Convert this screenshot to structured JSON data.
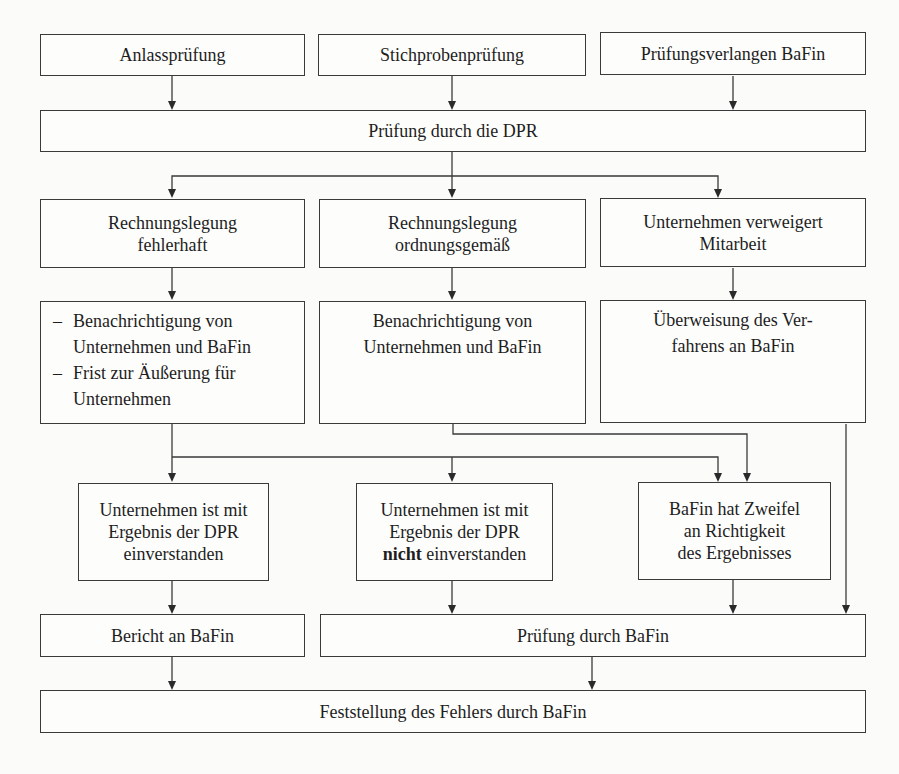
{
  "diagram": {
    "row1": [
      {
        "label": "Anlassprüfung"
      },
      {
        "label": "Stichprobenprüfung"
      },
      {
        "label": "Prüfungsverlangen BaFin"
      }
    ],
    "row2": {
      "label": "Prüfung durch die DPR"
    },
    "row3": [
      {
        "line1": "Rechnungslegung",
        "line2": "fehlerhaft"
      },
      {
        "line1": "Rechnungslegung",
        "line2": "ordnungsgemäß"
      },
      {
        "line1": "Unternehmen verweigert",
        "line2": "Mitarbeit"
      }
    ],
    "row4": {
      "left": {
        "items": [
          {
            "dash": "–",
            "line1": "Benachrichtigung von",
            "line2": "Unternehmen und BaFin"
          },
          {
            "dash": "–",
            "line1": "Frist zur Äußerung für",
            "line2": "Unternehmen"
          }
        ]
      },
      "middle": {
        "line1": "Benachrichtigung von",
        "line2": "Unternehmen und BaFin"
      },
      "right": {
        "line1": "Überweisung des Ver-",
        "line2": "fahrens an BaFin"
      }
    },
    "row5": [
      {
        "line1": "Unternehmen ist mit",
        "line2": "Ergebnis der DPR",
        "line3": "einverstanden"
      },
      {
        "line1": "Unternehmen ist mit",
        "line2": "Ergebnis der DPR",
        "line3_bold": "nicht",
        "line3_rest": " einverstanden"
      },
      {
        "line1": "BaFin hat Zweifel",
        "line2": "an Richtigkeit",
        "line3": "des Ergebnisses"
      }
    ],
    "row6": [
      {
        "label": "Bericht an BaFin"
      },
      {
        "label": "Prüfung durch BaFin"
      }
    ],
    "row7": {
      "label": "Feststellung des Fehlers durch BaFin"
    },
    "colors": {
      "line": "#3a3a3a",
      "background": "#fbfbfa",
      "text": "#1e1e1e"
    }
  }
}
